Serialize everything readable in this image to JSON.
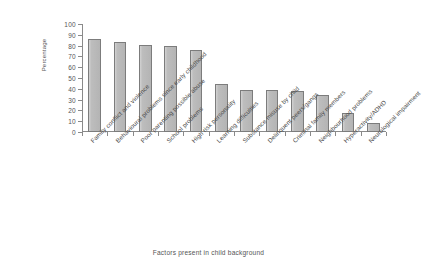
{
  "chart_data": {
    "type": "bar",
    "title": "",
    "xlabel": "Factors present in child background",
    "ylabel": "Percentage",
    "ylim": [
      0,
      100
    ],
    "ytick_step": 10,
    "yticks": [
      0,
      10,
      20,
      30,
      40,
      50,
      60,
      70,
      80,
      90,
      100
    ],
    "grid": false,
    "legend": false,
    "bar_color": "#bdbdbd",
    "bar_border_color": "#7c7c7c",
    "axis_color": "#8a8a8a",
    "categories": [
      "Family conflict and violence",
      "Behavioural problems since early childhood",
      "Poor parenting possible abuse",
      "School problems",
      "High risk personality",
      "Learning difficulties",
      "Substance misuse by child",
      "Delinquent peers/gangs",
      "Criminal family members",
      "Neighbourhood problems",
      "Hyperactivity/ADHD",
      "Neurological impairment"
    ],
    "values": [
      86,
      83,
      81,
      80,
      76,
      44,
      39,
      39,
      38,
      34,
      18,
      8
    ]
  }
}
